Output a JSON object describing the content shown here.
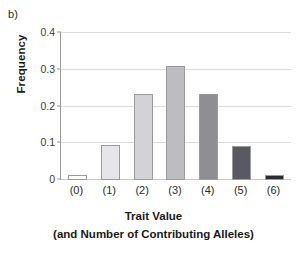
{
  "panel": {
    "label": "b)"
  },
  "chart_data": {
    "type": "bar",
    "title": "",
    "xlabel": "Trait Value",
    "xlabel_line2": "(and Number of Contributing Alleles)",
    "ylabel": "Frequency",
    "categories": [
      "(0)",
      "(1)",
      "(2)",
      "(3)",
      "(4)",
      "(5)",
      "(6)"
    ],
    "values": [
      0.015,
      0.095,
      0.233,
      0.31,
      0.233,
      0.093,
      0.015
    ],
    "ylim": [
      0,
      0.4
    ],
    "yticks": [
      0,
      0.1,
      0.2,
      0.3,
      0.4
    ],
    "ytick_labels": [
      "0",
      "0.1",
      "0.2",
      "0.3",
      "0.4"
    ],
    "grid": "horizontal",
    "legend": "none",
    "bar_colors": [
      "#ffffff",
      "#e6e6ea",
      "#d2d2d7",
      "#bcbcc1",
      "#8e8e93",
      "#595961",
      "#2b2b31"
    ],
    "bar_border_color": "#9b9b9b"
  }
}
